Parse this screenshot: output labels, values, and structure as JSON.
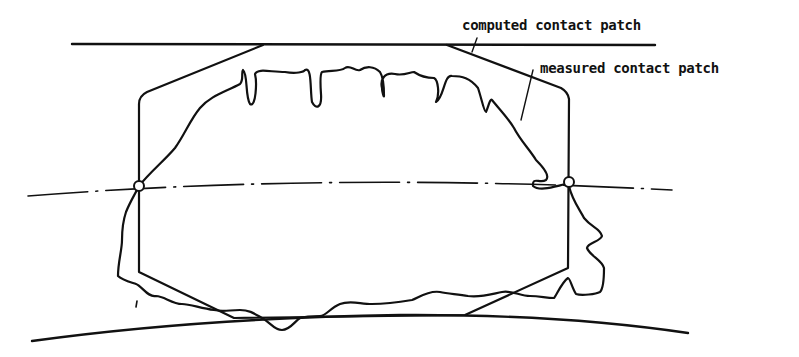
{
  "diagram": {
    "labels": {
      "computed": "computed contact patch",
      "measured": "measured contact patch"
    },
    "elements": [
      "upper-boundary-line",
      "lower-boundary-curve",
      "center-dash-dot-line",
      "computed-contact-patch-hexagon",
      "measured-contact-patch-outline",
      "left-pivot-point",
      "right-pivot-point"
    ],
    "colors": {
      "stroke": "#111111",
      "background": "#ffffff"
    }
  }
}
